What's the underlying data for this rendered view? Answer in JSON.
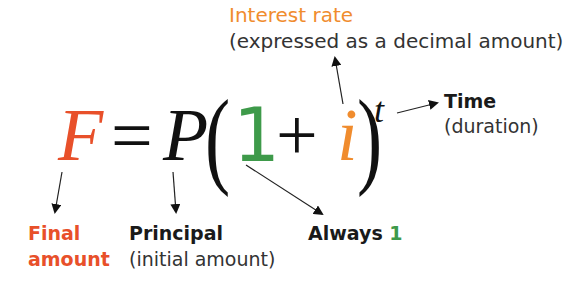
{
  "colors": {
    "final": "#e8502a",
    "one": "#3e9a4a",
    "interest": "#f08c2e",
    "text": "#1a1a1a",
    "subtext": "#333333"
  },
  "formula": {
    "F": "F",
    "equals": "=",
    "P": "P",
    "open_paren": "(",
    "one": "1",
    "plus": "+",
    "i": "i",
    "close_paren": ")",
    "t": "t"
  },
  "annotations": {
    "interest_rate": {
      "title": "Interest rate",
      "subtitle": "(expressed as a decimal amount)"
    },
    "time": {
      "title": "Time",
      "subtitle": "(duration)"
    },
    "final_amount": {
      "line1": "Final",
      "line2": "amount"
    },
    "principal": {
      "title": "Principal",
      "subtitle": "(initial amount)"
    },
    "always_one": {
      "prefix": "Always ",
      "value": "1"
    }
  }
}
